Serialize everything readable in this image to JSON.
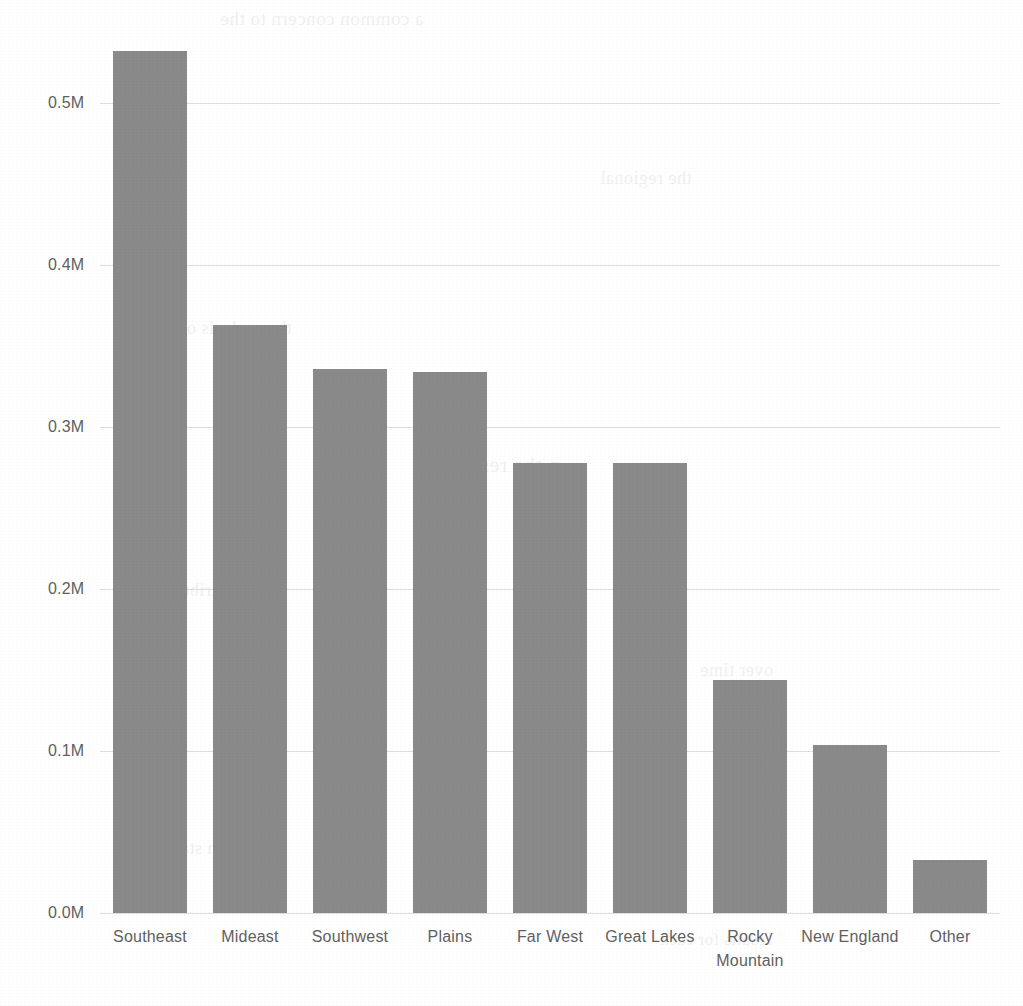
{
  "chart_data": {
    "type": "bar",
    "title": "",
    "subtitle": "",
    "xlabel": "",
    "ylabel": "",
    "categories": [
      "Southeast",
      "Mideast",
      "Southwest",
      "Plains",
      "Far West",
      "Great Lakes",
      "Rocky Mountain",
      "New England",
      "Other"
    ],
    "values": [
      532000,
      363000,
      336000,
      334000,
      278000,
      278000,
      144000,
      104000,
      33000
    ],
    "ylim": [
      0,
      532000
    ],
    "y_axis_max_gridline": 500000,
    "y_tick_values": [
      500000,
      400000,
      300000,
      200000,
      100000,
      0
    ],
    "y_tick_labels": [
      "0.5M",
      "0.4M",
      "0.3M",
      "0.2M",
      "0.1M",
      "0.0M"
    ],
    "grid": true,
    "grid_axis": "y",
    "legend": false,
    "legend_position": "none",
    "orientation": "vertical",
    "bar_color": "#8a8a8a",
    "gridline_color": "#d8d8d8",
    "tick_label_color": "#5f5f5f",
    "background_color": "#ffffff"
  },
  "scan_artifacts": {
    "bleed_through_lines": [
      "a common concern to the",
      "the regional",
      "the analysis of",
      "n the research",
      "the distribution",
      "over time",
      "in states with",
      "results for each"
    ]
  }
}
